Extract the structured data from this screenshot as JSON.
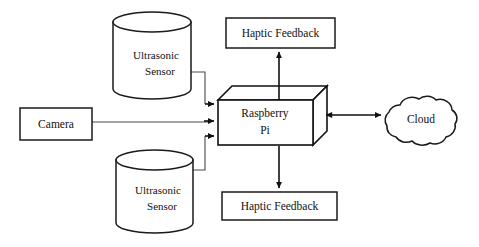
{
  "diagram": {
    "background_color": "#ffffff",
    "stroke_color": "#111111",
    "nodes": {
      "ultrasonic_top": {
        "label_line1": "Ultrasonic",
        "label_line2": "Sensor",
        "shape": "cylinder"
      },
      "ultrasonic_bottom": {
        "label_line1": "Ultrasonic",
        "label_line2": "Sensor",
        "shape": "cylinder"
      },
      "camera": {
        "label": "Camera",
        "shape": "rectangle"
      },
      "raspberry_pi": {
        "label_line1": "Raspberry",
        "label_line2": "Pi",
        "shape": "cuboid-3d"
      },
      "haptic_top": {
        "label": "Haptic Feedback",
        "shape": "rectangle"
      },
      "haptic_bottom": {
        "label": "Haptic Feedback",
        "shape": "rectangle"
      },
      "cloud": {
        "label": "Cloud",
        "shape": "cloud"
      }
    },
    "connections": [
      {
        "name": "ultrasonic-top-to-pi",
        "from": "ultrasonic_top",
        "to": "raspberry_pi",
        "direction": "one-way"
      },
      {
        "name": "camera-to-pi",
        "from": "camera",
        "to": "raspberry_pi",
        "direction": "one-way"
      },
      {
        "name": "ultrasonic-bottom-to-pi",
        "from": "ultrasonic_bottom",
        "to": "raspberry_pi",
        "direction": "one-way"
      },
      {
        "name": "pi-to-haptic-top",
        "from": "raspberry_pi",
        "to": "haptic_top",
        "direction": "one-way"
      },
      {
        "name": "pi-to-haptic-bottom",
        "from": "raspberry_pi",
        "to": "haptic_bottom",
        "direction": "one-way"
      },
      {
        "name": "pi-to-cloud",
        "from": "raspberry_pi",
        "to": "cloud",
        "direction": "two-way"
      }
    ]
  }
}
